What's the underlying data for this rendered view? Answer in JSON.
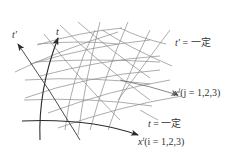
{
  "figure": {
    "axes": {
      "t_label": "t",
      "t_prime_label": "t′"
    },
    "annotations": {
      "t_prime_const": {
        "var": "t′",
        "eq": " = ",
        "text": "一定"
      },
      "xj_curve": {
        "var": "x",
        "sup": "j",
        "paren": "(j = 1,2,3)"
      },
      "t_const": {
        "var": "t",
        "eq": " = ",
        "text": "一定"
      },
      "xi_curve": {
        "var": "x",
        "sup": "i",
        "paren": "(i = 1,2,3)"
      }
    },
    "colors": {
      "grid_line": "#8a8a8a",
      "bold_line": "#2a2a2a",
      "text": "#333333",
      "background": "#ffffff"
    }
  }
}
